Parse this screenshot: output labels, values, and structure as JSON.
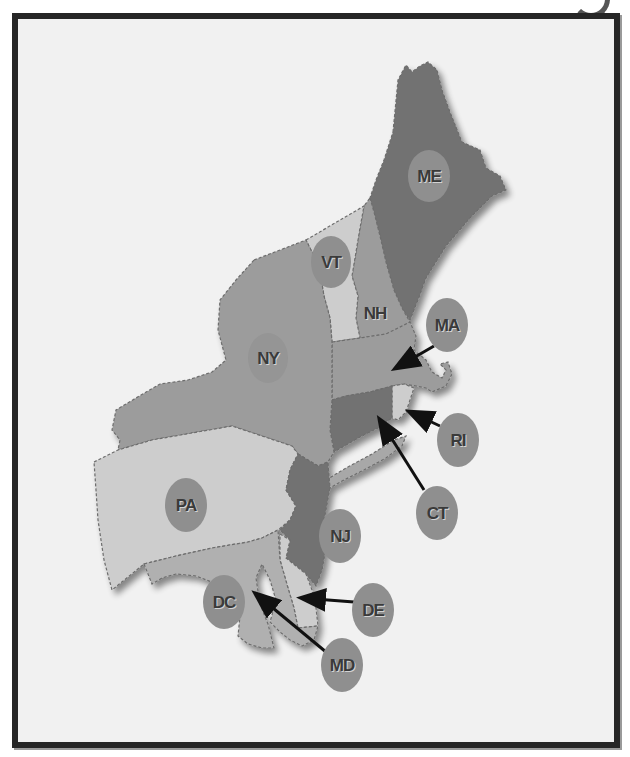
{
  "map": {
    "region": "Northeastern United States",
    "colors": {
      "background": "#f1f1f1",
      "frame": "#262626",
      "light_fill": "#cdcdcd",
      "medium_fill": "#9c9c9c",
      "dark_fill": "#727272",
      "label_circle": "#8f8f8f",
      "label_text": "#3a3a3a",
      "arrow": "#111111"
    },
    "states": [
      {
        "abbr": "ME",
        "shade": "dark"
      },
      {
        "abbr": "VT",
        "shade": "light"
      },
      {
        "abbr": "NH",
        "shade": "medium"
      },
      {
        "abbr": "MA",
        "shade": "medium"
      },
      {
        "abbr": "NY",
        "shade": "medium"
      },
      {
        "abbr": "RI",
        "shade": "light"
      },
      {
        "abbr": "CT",
        "shade": "dark"
      },
      {
        "abbr": "PA",
        "shade": "light"
      },
      {
        "abbr": "NJ",
        "shade": "dark"
      },
      {
        "abbr": "DE",
        "shade": "light"
      },
      {
        "abbr": "DC",
        "shade": "medium"
      },
      {
        "abbr": "MD",
        "shade": "medium"
      }
    ],
    "labels": {
      "ME": "ME",
      "VT": "VT",
      "NH": "NH",
      "MA": "MA",
      "NY": "NY",
      "RI": "RI",
      "CT": "CT",
      "PA": "PA",
      "NJ": "NJ",
      "DE": "DE",
      "DC": "DC",
      "MD": "MD"
    },
    "callouts_with_arrows": [
      "MA",
      "RI",
      "CT",
      "DE",
      "MD"
    ]
  }
}
